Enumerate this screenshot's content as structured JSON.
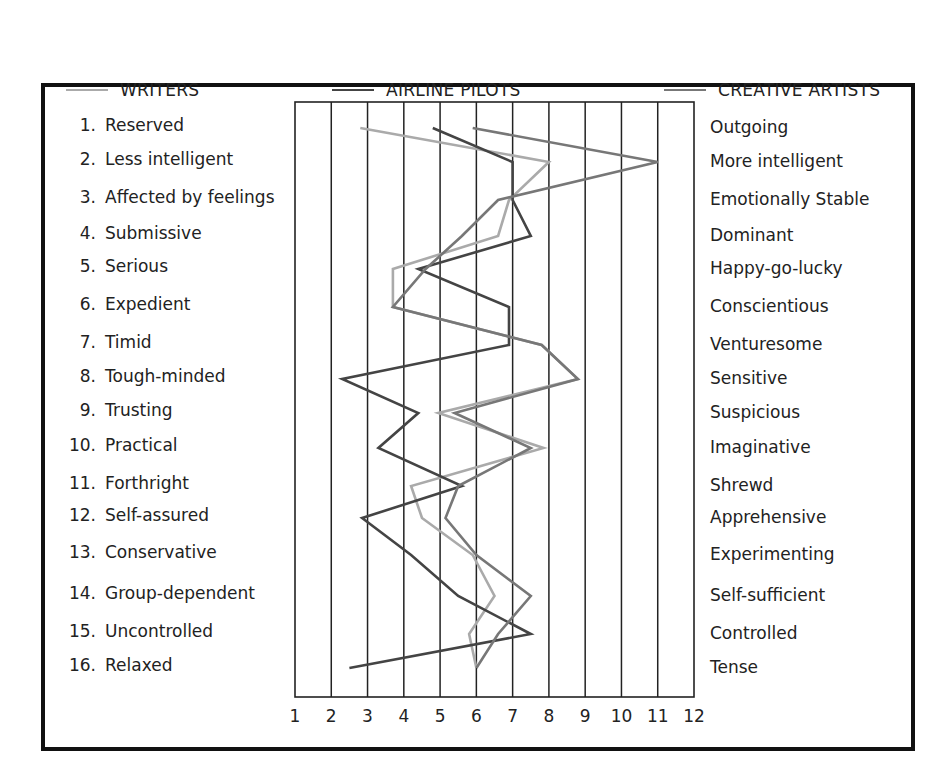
{
  "legend": [
    {
      "label": "WRITERS",
      "color": "#aaaaaa"
    },
    {
      "label": "AIRLINE PILOTS",
      "color": "#444444"
    },
    {
      "label": "CREATIVE ARTISTS",
      "color": "#777777"
    }
  ],
  "left_labels": [
    {
      "num": "1.",
      "text": "Reserved"
    },
    {
      "num": "2.",
      "text": "Less intelligent"
    },
    {
      "num": "3.",
      "text": "Affected by feelings"
    },
    {
      "num": "4.",
      "text": "Submissive"
    },
    {
      "num": "5.",
      "text": "Serious"
    },
    {
      "num": "6.",
      "text": "Expedient"
    },
    {
      "num": "7.",
      "text": "Timid"
    },
    {
      "num": "8.",
      "text": "Tough-minded"
    },
    {
      "num": "9.",
      "text": "Trusting"
    },
    {
      "num": "10.",
      "text": "Practical"
    },
    {
      "num": "11.",
      "text": "Forthright"
    },
    {
      "num": "12.",
      "text": "Self-assured"
    },
    {
      "num": "13.",
      "text": "Conservative"
    },
    {
      "num": "14.",
      "text": "Group-dependent"
    },
    {
      "num": "15.",
      "text": "Uncontrolled"
    },
    {
      "num": "16.",
      "text": "Relaxed"
    }
  ],
  "right_labels": [
    "Outgoing",
    "More intelligent",
    "Emotionally Stable",
    "Dominant",
    "Happy-go-lucky",
    "Conscientious",
    "Venturesome",
    "Sensitive",
    "Suspicious",
    "Imaginative",
    "Shrewd",
    "Apprehensive",
    "Experimenting",
    "Self-sufficient",
    "Controlled",
    "Tense"
  ],
  "x_ticks": [
    "1",
    "2",
    "3",
    "4",
    "5",
    "6",
    "7",
    "8",
    "9",
    "10",
    "11",
    "12"
  ],
  "chart_data": {
    "type": "line",
    "title": "",
    "orientation": "horizontal-profile",
    "xlabel": "",
    "ylabel": "",
    "xlim": [
      1,
      12
    ],
    "grid": "vertical",
    "legend_position": "top",
    "categories": [
      "Reserved / Outgoing",
      "Less intelligent / More intelligent",
      "Affected by feelings / Emotionally Stable",
      "Submissive / Dominant",
      "Serious / Happy-go-lucky",
      "Expedient / Conscientious",
      "Timid / Venturesome",
      "Tough-minded / Sensitive",
      "Trusting / Suspicious",
      "Practical / Imaginative",
      "Forthright / Shrewd",
      "Self-assured / Apprehensive",
      "Conservative / Experimenting",
      "Group-dependent / Self-sufficient",
      "Uncontrolled / Controlled",
      "Relaxed / Tense"
    ],
    "series": [
      {
        "name": "WRITERS",
        "color": "#aaaaaa",
        "values": [
          2.8,
          8.0,
          6.9,
          6.6,
          3.7,
          3.7,
          7.8,
          8.8,
          4.95,
          7.85,
          4.2,
          4.5,
          5.9,
          6.5,
          5.8,
          6.0
        ]
      },
      {
        "name": "AIRLINE PILOTS",
        "color": "#444444",
        "values": [
          4.8,
          7.0,
          7.0,
          7.5,
          4.4,
          6.9,
          6.9,
          2.3,
          4.4,
          3.3,
          5.6,
          2.85,
          4.2,
          5.5,
          7.5,
          2.5
        ]
      },
      {
        "name": "CREATIVE ARTISTS",
        "color": "#777777",
        "values": [
          5.9,
          11.0,
          6.6,
          5.6,
          4.6,
          3.7,
          7.8,
          8.8,
          5.4,
          7.5,
          5.5,
          5.15,
          6.0,
          7.5,
          6.6,
          6.0
        ]
      }
    ]
  }
}
